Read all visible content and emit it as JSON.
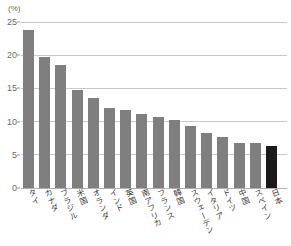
{
  "chart_data": {
    "type": "bar",
    "title": "",
    "xlabel": "",
    "ylabel": "",
    "unit_label": "(%)",
    "ylim": [
      0,
      25
    ],
    "yticks": [
      0,
      5,
      10,
      15,
      20,
      25
    ],
    "ytick_labels": [
      "0",
      "5",
      "10",
      "15",
      "20",
      "25"
    ],
    "grid": true,
    "legend": "none",
    "categories": [
      "タイ",
      "カナダ",
      "ブラジル",
      "米国",
      "オランダ",
      "インド",
      "英国",
      "南アフリカ",
      "フランス",
      "韓国",
      "スウェーデン",
      "イタリア",
      "ドイツ",
      "中国",
      "スペイン",
      "日本"
    ],
    "values": [
      23.8,
      19.8,
      18.6,
      14.7,
      13.6,
      12.0,
      11.8,
      11.1,
      10.7,
      10.3,
      9.3,
      8.3,
      7.7,
      6.8,
      6.8,
      6.3
    ],
    "highlight_index": 15,
    "colors": {
      "bar": "#7f7f7f",
      "bar_highlight": "#1a1a1a",
      "gridline": "#c9c9c9",
      "baseline": "#b0b0b0",
      "text": "#3c3c3c",
      "tick_text": "#6a6a6a",
      "background": "#ffffff"
    }
  }
}
